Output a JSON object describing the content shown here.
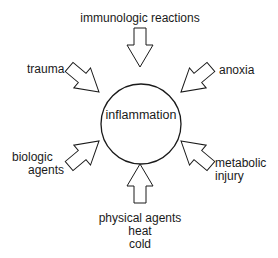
{
  "diagram": {
    "center": {
      "label": "inflammation"
    },
    "causes": [
      {
        "id": "top",
        "lines": [
          "immunologic reactions"
        ]
      },
      {
        "id": "upper-left",
        "lines": [
          "trauma"
        ]
      },
      {
        "id": "upper-right",
        "lines": [
          "anoxia"
        ]
      },
      {
        "id": "lower-left",
        "lines": [
          "biologic",
          "agents"
        ]
      },
      {
        "id": "lower-right",
        "lines": [
          "metabolic",
          "injury"
        ]
      },
      {
        "id": "bottom",
        "lines": [
          "physical agents",
          "heat",
          "cold"
        ]
      }
    ],
    "colors": {
      "stroke": "#1a1a1a",
      "background": "#ffffff"
    }
  }
}
